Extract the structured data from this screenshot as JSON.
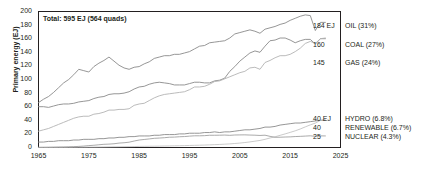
{
  "chart_data": {
    "type": "line",
    "title": "Total: 595 EJ (564 quads)",
    "xlabel": "",
    "ylabel": "Primary energy (EJ)",
    "xlim": [
      1965,
      2025
    ],
    "ylim": [
      0,
      200
    ],
    "xticks": [
      "1965",
      "1975",
      "1985",
      "1995",
      "2005",
      "2015",
      "2025"
    ],
    "yticks": [
      "0",
      "20",
      "40",
      "60",
      "80",
      "100",
      "120",
      "140",
      "160",
      "180",
      "200"
    ],
    "grid": false,
    "legend_position": "right-inline",
    "x": [
      1965,
      1966,
      1967,
      1968,
      1969,
      1970,
      1971,
      1972,
      1973,
      1974,
      1975,
      1976,
      1977,
      1978,
      1979,
      1980,
      1981,
      1982,
      1983,
      1984,
      1985,
      1986,
      1987,
      1988,
      1989,
      1990,
      1991,
      1992,
      1993,
      1994,
      1995,
      1996,
      1997,
      1998,
      1999,
      2000,
      2001,
      2002,
      2003,
      2004,
      2005,
      2006,
      2007,
      2008,
      2009,
      2010,
      2011,
      2012,
      2013,
      2014,
      2015,
      2016,
      2017,
      2018,
      2019,
      2020,
      2021,
      2022
    ],
    "series": [
      {
        "name": "OIL",
        "share": "31%",
        "end_value": 184,
        "end_label": "184 EJ",
        "legend_label": "OIL (31%)",
        "color": "#8a8a8a",
        "values": [
          66,
          71,
          75,
          81,
          88,
          95,
          100,
          107,
          115,
          113,
          111,
          119,
          124,
          128,
          133,
          127,
          121,
          117,
          115,
          118,
          119,
          123,
          126,
          131,
          133,
          135,
          135,
          137,
          137,
          139,
          141,
          145,
          149,
          150,
          154,
          155,
          156,
          157,
          161,
          167,
          169,
          171,
          173,
          171,
          168,
          174,
          176,
          178,
          181,
          183,
          187,
          190,
          193,
          195,
          194,
          172,
          184,
          184
        ]
      },
      {
        "name": "COAL",
        "share": "27%",
        "end_value": 160,
        "end_label": "160",
        "legend_label": "COAL (27%)",
        "color": "#8a8a8a",
        "values": [
          60,
          60,
          59,
          61,
          63,
          64,
          64,
          65,
          67,
          68,
          69,
          72,
          74,
          75,
          78,
          79,
          79,
          80,
          82,
          86,
          89,
          90,
          93,
          95,
          96,
          95,
          94,
          92,
          92,
          92,
          94,
          96,
          96,
          95,
          95,
          98,
          99,
          102,
          112,
          119,
          127,
          133,
          139,
          142,
          140,
          149,
          157,
          158,
          161,
          161,
          158,
          154,
          157,
          159,
          159,
          152,
          160,
          160
        ]
      },
      {
        "name": "GAS",
        "share": "24%",
        "end_value": 145,
        "end_label": "145",
        "legend_label": "GAS (24%)",
        "color": "#b3b3b3",
        "values": [
          24,
          26,
          28,
          31,
          34,
          37,
          40,
          43,
          45,
          46,
          46,
          49,
          50,
          52,
          55,
          55,
          56,
          56,
          57,
          62,
          64,
          65,
          69,
          73,
          76,
          78,
          79,
          80,
          81,
          82,
          85,
          89,
          89,
          90,
          93,
          97,
          98,
          101,
          104,
          107,
          110,
          112,
          117,
          118,
          115,
          125,
          128,
          132,
          135,
          135,
          137,
          141,
          146,
          153,
          156,
          153,
          160,
          161
        ]
      },
      {
        "name": "HYDRO",
        "share": "6.8%",
        "end_value": 40,
        "end_label": "40 EJ",
        "legend_label": "HYDRO (6.8%)",
        "color": "#8a8a8a",
        "values": [
          8,
          8,
          9,
          9,
          10,
          10,
          10,
          11,
          11,
          12,
          12,
          12,
          13,
          13,
          14,
          14,
          15,
          15,
          16,
          16,
          17,
          17,
          17,
          18,
          18,
          19,
          19,
          19,
          20,
          20,
          21,
          21,
          21,
          22,
          22,
          23,
          22,
          23,
          23,
          24,
          25,
          26,
          26,
          27,
          28,
          30,
          30,
          31,
          33,
          34,
          35,
          36,
          36,
          37,
          38,
          39,
          40,
          40
        ]
      },
      {
        "name": "RENEWABLE",
        "share": "6.7%",
        "end_value": 40,
        "end_label": "40",
        "legend_label": "RENEWABLE (6.7%)",
        "color": "#c4c4c4",
        "values": [
          0.2,
          0.2,
          0.2,
          0.3,
          0.3,
          0.3,
          0.4,
          0.4,
          0.5,
          0.5,
          0.6,
          0.6,
          0.7,
          0.8,
          0.9,
          1.0,
          1.1,
          1.2,
          1.3,
          1.4,
          1.6,
          1.7,
          1.8,
          1.9,
          2.0,
          2.2,
          2.3,
          2.5,
          2.6,
          2.8,
          3.0,
          3.2,
          3.4,
          3.6,
          3.9,
          4.2,
          4.5,
          4.9,
          5.3,
          5.9,
          6.5,
          7.3,
          8.2,
          9.3,
          10.4,
          12.0,
          14.0,
          15.8,
          17.9,
          20.0,
          22.2,
          24.5,
          27.2,
          30.3,
          33.3,
          35.9,
          39.9,
          42.0
        ]
      },
      {
        "name": "NUCLEAR",
        "share": "4.3%",
        "end_value": 25,
        "end_label": "25",
        "legend_label": "NUCLEAR (4.3%)",
        "color": "#a0a0a0",
        "values": [
          0.2,
          0.3,
          0.4,
          0.5,
          0.7,
          0.8,
          1.0,
          1.3,
          1.6,
          2.1,
          2.8,
          3.3,
          4.0,
          4.7,
          5.0,
          5.5,
          6.5,
          7.0,
          7.8,
          9.5,
          11.0,
          11.8,
          12.6,
          13.5,
          13.9,
          14.4,
          15.1,
          15.3,
          15.8,
          16.1,
          16.7,
          17.2,
          17.2,
          17.4,
          18.0,
          18.0,
          18.1,
          18.3,
          17.9,
          18.4,
          18.5,
          18.6,
          18.3,
          18.1,
          17.7,
          18.1,
          16.4,
          15.0,
          15.1,
          15.4,
          15.6,
          16.1,
          16.4,
          16.8,
          17.2,
          16.4,
          17.1,
          17.0
        ]
      }
    ]
  }
}
